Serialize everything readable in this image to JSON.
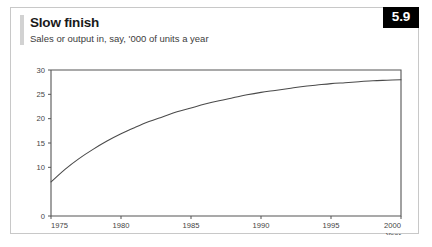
{
  "card": {
    "title": "Slow finish",
    "subtitle": "Sales or output in, say, '000 of units a year",
    "badge": "5.9"
  },
  "chart_data": {
    "type": "line",
    "title": "Slow finish",
    "subtitle": "Sales or output in, say, '000 of units a year",
    "xlabel": "Year",
    "ylabel": "",
    "xlim": [
      1975,
      2000
    ],
    "ylim": [
      0,
      30
    ],
    "grid": false,
    "legend": null,
    "x_ticks": [
      1975,
      1980,
      1985,
      1990,
      1995,
      2000
    ],
    "x_tick_labels": [
      "1975",
      "1980",
      "1985",
      "1990",
      "1995",
      "2000"
    ],
    "y_ticks": [
      0,
      10,
      15,
      20,
      25,
      30
    ],
    "y_tick_labels": [
      "0",
      "10",
      "15",
      "20",
      "25",
      "30"
    ],
    "series": [
      {
        "name": "Sales or output",
        "x": [
          1975,
          1976,
          1977,
          1978,
          1979,
          1980,
          1981,
          1982,
          1983,
          1984,
          1985,
          1986,
          1987,
          1988,
          1989,
          1990,
          1991,
          1992,
          1993,
          1994,
          1995,
          1996,
          1997,
          1998,
          1999,
          2000
        ],
        "values": [
          7.0,
          9.6,
          11.8,
          13.7,
          15.4,
          16.9,
          18.2,
          19.4,
          20.4,
          21.4,
          22.2,
          23.0,
          23.7,
          24.3,
          24.9,
          25.4,
          25.8,
          26.2,
          26.6,
          26.9,
          27.2,
          27.4,
          27.6,
          27.8,
          27.9,
          28.0
        ]
      }
    ],
    "annotations": []
  },
  "axis": {
    "x_caption": "Year"
  }
}
